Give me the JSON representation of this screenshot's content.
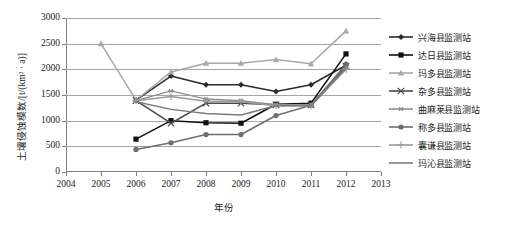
{
  "chart_data": {
    "type": "line",
    "title": "",
    "xlabel": "年份",
    "ylabel": "土壤侵蚀模数/[t/(km² · a)]",
    "x": [
      2004,
      2005,
      2006,
      2007,
      2008,
      2009,
      2010,
      2011,
      2012,
      2013
    ],
    "xlim": [
      2004,
      2013
    ],
    "ylim": [
      0,
      3000
    ],
    "yticks": [
      0,
      500,
      1000,
      1500,
      2000,
      2500,
      3000
    ],
    "xticks": [
      "2004",
      "2005",
      "2006",
      "2007",
      "2008",
      "2009",
      "2010",
      "2011",
      "2012",
      "2013"
    ],
    "grid": true,
    "legend_position": "right",
    "series": [
      {
        "name": "兴海县监测站",
        "marker": "diamond",
        "color": "#2b2b2b",
        "x": [
          2006,
          2007,
          2008,
          2009,
          2010,
          2011,
          2012
        ],
        "values": [
          1400,
          1870,
          1700,
          1700,
          1570,
          1700,
          2080
        ]
      },
      {
        "name": "达日县监测站",
        "marker": "square",
        "color": "#111111",
        "x": [
          2006,
          2007,
          2008,
          2009,
          2010,
          2011,
          2012
        ],
        "values": [
          640,
          1000,
          960,
          950,
          1320,
          1340,
          2300
        ]
      },
      {
        "name": "玛多县监测站",
        "marker": "triangle",
        "color": "#a8a8a8",
        "x": [
          2005,
          2006,
          2007,
          2008,
          2009,
          2010,
          2011,
          2012
        ],
        "values": [
          2500,
          1400,
          1950,
          2120,
          2120,
          2190,
          2110,
          2750
        ]
      },
      {
        "name": "杂多县监测站",
        "marker": "x-cross",
        "color": "#4a4a4a",
        "x": [
          2006,
          2007,
          2008,
          2009,
          2010,
          2011,
          2012
        ],
        "values": [
          1390,
          950,
          1340,
          1340,
          1310,
          1310,
          2060
        ]
      },
      {
        "name": "曲麻莱县监测站",
        "marker": "asterisk",
        "color": "#8f8f8f",
        "x": [
          2006,
          2007,
          2008,
          2009,
          2010,
          2011,
          2012
        ],
        "values": [
          1390,
          1580,
          1420,
          1390,
          1310,
          1310,
          2020
        ]
      },
      {
        "name": "称多县监测站",
        "marker": "circle",
        "color": "#6e6e6e",
        "x": [
          2006,
          2007,
          2008,
          2009,
          2010,
          2011,
          2012
        ],
        "values": [
          440,
          570,
          730,
          730,
          1100,
          1300,
          2100
        ]
      },
      {
        "name": "囊谦县监测站",
        "marker": "plus",
        "color": "#9a9a9a",
        "x": [
          2006,
          2007,
          2008,
          2009,
          2010,
          2011,
          2012
        ],
        "values": [
          1390,
          1470,
          1380,
          1370,
          1290,
          1290,
          2000
        ]
      },
      {
        "name": "玛沁县监测站",
        "marker": "none",
        "color": "#7a7a7a",
        "x": [
          2006,
          2007,
          2008,
          2009,
          2010,
          2011,
          2012
        ],
        "values": [
          1370,
          1220,
          1140,
          1110,
          1290,
          1290,
          2020
        ]
      }
    ]
  }
}
